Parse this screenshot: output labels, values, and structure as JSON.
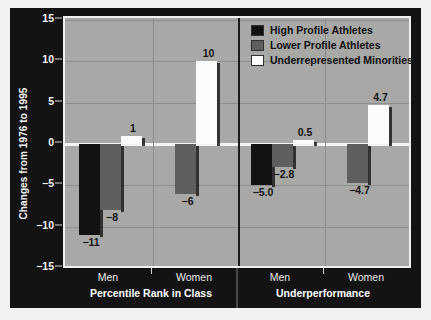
{
  "chart_data": {
    "type": "bar",
    "title": "",
    "xlabel": "",
    "ylabel": "Changes from 1976 to 1995",
    "ylim": [
      -15,
      15
    ],
    "yticks": [
      15,
      10,
      5,
      0,
      -5,
      -10,
      -15
    ],
    "ytick_labels": [
      "15",
      "10",
      "5",
      "0",
      "−5",
      "−10",
      "−15"
    ],
    "grid": true,
    "legend_position": "top-right",
    "panels": [
      "Percentile Rank in Class",
      "Underperformance"
    ],
    "categories": [
      "Men",
      "Women",
      "Men",
      "Women"
    ],
    "group_labels": [
      {
        "group": "Percentile Rank in Class",
        "ticks": [
          "Men",
          "Women"
        ]
      },
      {
        "group": "Underperformance",
        "ticks": [
          "Men",
          "Women"
        ]
      }
    ],
    "series": [
      {
        "name": "High Profile Athletes",
        "color": "#121212",
        "values": [
          -11,
          null,
          -5.0,
          null
        ],
        "labels": [
          "−11",
          "",
          "−5.0",
          ""
        ]
      },
      {
        "name": "Lower Profile Athletes",
        "color": "#5f5f5e",
        "values": [
          -8,
          -6,
          -2.8,
          -4.7
        ],
        "labels": [
          "−8",
          "−6",
          "−2.8",
          "−4.7"
        ]
      },
      {
        "name": "Underrepresented Minorities",
        "color": "#fbfbf9",
        "values": [
          1,
          10,
          0.5,
          4.7
        ],
        "labels": [
          "1",
          "10",
          "0.5",
          "4.7"
        ]
      }
    ]
  },
  "legend": {
    "items": [
      {
        "label": "High Profile Athletes",
        "color": "#121212"
      },
      {
        "label": "Lower Profile Athletes",
        "color": "#5f5f5e"
      },
      {
        "label": "Underrepresented Minorities",
        "color": "#fbfbf9"
      }
    ]
  },
  "axis": {
    "y_title": "Changes from 1976 to 1995",
    "y_tick_labels": [
      "15",
      "10",
      "5",
      "0",
      "−5",
      "−10",
      "−15"
    ]
  },
  "xaxis": {
    "ticks": [
      "Men",
      "Women",
      "Men",
      "Women"
    ],
    "groups": [
      "Percentile Rank in Class",
      "Underperformance"
    ]
  }
}
